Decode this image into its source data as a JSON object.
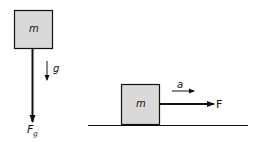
{
  "diagram": {
    "left_figure": {
      "block_label": "m",
      "gravity_label": "g",
      "force_label": "F",
      "force_subscript": "g"
    },
    "right_figure": {
      "block_label": "m",
      "acceleration_label": "a",
      "force_label": "F"
    },
    "colors": {
      "block_fill": "#d9d9d9",
      "stroke": "#111111"
    }
  }
}
